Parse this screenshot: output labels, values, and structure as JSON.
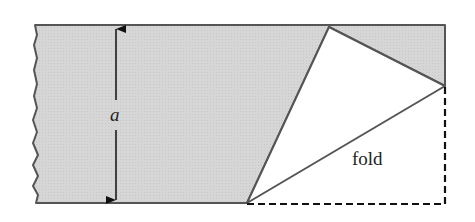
{
  "diagram": {
    "labels": {
      "height": "a",
      "fold": "fold"
    },
    "colors": {
      "paper_fill": "#d4d4d4",
      "edge": "#555555",
      "folded_flap": "#ffffff",
      "dashed": "#111111",
      "arrow": "#111111"
    }
  }
}
